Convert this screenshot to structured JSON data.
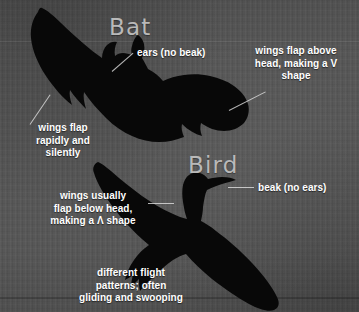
{
  "infographic": {
    "background_color": "#575757",
    "text_color": "#ffffff",
    "heading_color": "#b9b9b9",
    "silhouette_color": "#080808"
  },
  "bat": {
    "heading": "Bat",
    "annotations": {
      "ears": "ears (no beak)",
      "v_shape": "wings flap above\nhead, making a V\nshape",
      "rapid": "wings flap\nrapidly and\nsilently"
    }
  },
  "bird": {
    "heading": "Bird",
    "annotations": {
      "beak": "beak (no ears)",
      "below_head": "wings usually\nflap below head,\nmaking a Λ shape",
      "gliding": "different flight\npatterns; often\ngliding and swooping"
    }
  }
}
